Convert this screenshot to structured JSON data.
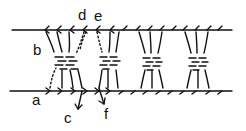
{
  "diagram": {
    "type": "schematic line drawing",
    "stroke_color": "#111111",
    "background": "#ffffff",
    "filaments": [
      {
        "name": "top-filament",
        "y": 30,
        "x_start": 12,
        "x_end": 232,
        "arrow_direction": "left"
      },
      {
        "name": "bottom-filament",
        "y": 91,
        "x_start": 10,
        "x_end": 232,
        "arrow_direction": "right"
      }
    ],
    "bundles": [
      {
        "x_center": 70
      },
      {
        "x_center": 110
      },
      {
        "x_center": 150
      },
      {
        "x_center": 195
      }
    ]
  },
  "labels": {
    "a": "a",
    "b": "b",
    "c": "c",
    "d": "d",
    "e": "e",
    "f": "f"
  }
}
